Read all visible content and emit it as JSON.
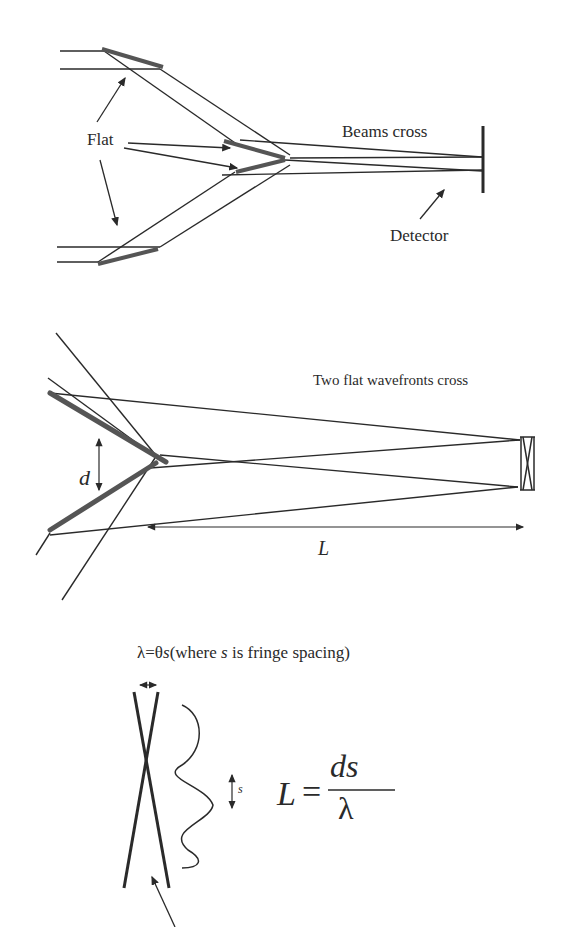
{
  "panel1": {
    "labels": {
      "flat": "Flat",
      "beams_cross": "Beams  cross",
      "detector": "Detector"
    }
  },
  "panel2": {
    "labels": {
      "caption": "Two flat wavefronts cross",
      "d": "d",
      "L": "L"
    }
  },
  "panel3": {
    "labels": {
      "relation_lambda": "λ",
      "relation_eq": "=",
      "relation_theta": "θ",
      "relation_s": "s",
      "relation_rest_pre": "(where ",
      "relation_rest_s": "s",
      "relation_rest_post": " is fringe spacing)",
      "s": "s",
      "formula_L": "L",
      "formula_eq": "=",
      "formula_num": "ds",
      "formula_den": "λ"
    }
  },
  "colors": {
    "ink": "#2a2a2a",
    "mirror": "#555555",
    "background": "#ffffff"
  }
}
